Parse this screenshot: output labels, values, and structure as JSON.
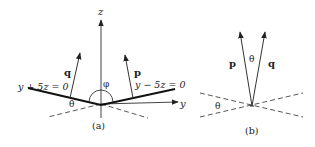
{
  "panel_a": {
    "caption": "(a)",
    "axis_z_label": "z",
    "axis_y_label": "y",
    "plane_left_label": "y + 5z = 0",
    "plane_right_label": "y − 5z = 0",
    "vector_q_label": "q",
    "vector_p_label": "p",
    "angle_phi_label": "φ",
    "angle_theta_label": "θ"
  },
  "panel_b": {
    "caption": "(b)",
    "vector_p_label": "p",
    "vector_q_label": "q",
    "angle_between_label": "θ",
    "angle_dashed_label": "θ"
  },
  "colors": {
    "line": "#222222",
    "background": "#ffffff"
  }
}
